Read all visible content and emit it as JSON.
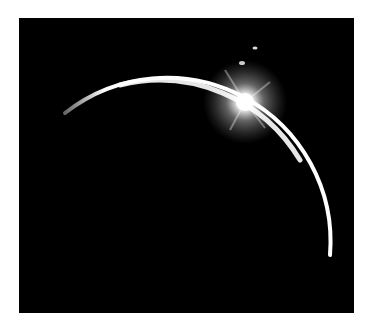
{
  "image": {
    "subject": "crescent-limb-with-sun-flare",
    "colors": {
      "background": "#ffffff",
      "sky": "#000000",
      "limb": "#ffffff",
      "flare": "#ffffff"
    }
  }
}
